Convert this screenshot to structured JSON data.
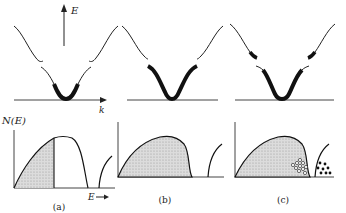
{
  "figure": {
    "band_axis_label_energy": "E",
    "band_axis_label_k": "k",
    "dos_axis_label": "N(E)",
    "dos_energy_arrow_label": "E",
    "panels": [
      {
        "id": "a",
        "caption": "(a)",
        "description": "Lower band partially filled (thick segment near band bottom); DOS shaded up to Fermi level marked by vertical line"
      },
      {
        "id": "b",
        "caption": "(b)",
        "description": "Lower band completely filled; DOS of lower band fully shaded, upper band empty"
      },
      {
        "id": "c",
        "caption": "(c)",
        "description": "Lower band nearly full with holes (open circles) near top; upper band with a few electrons (filled circles) near bottom"
      }
    ],
    "legend": {
      "holes": "open circles",
      "electrons": "filled circles"
    },
    "colors": {
      "line": "#1a1a1a",
      "fill_shaded": "#d4d4d4",
      "axis": "#555555"
    }
  }
}
